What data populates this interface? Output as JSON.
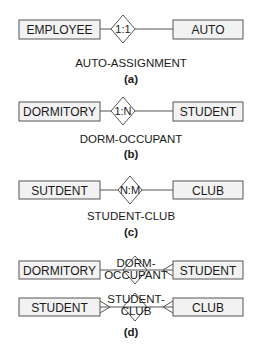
{
  "panels": [
    {
      "id": "a",
      "left_entity": "EMPLOYEE",
      "cardinality": "1:1",
      "right_entity": "AUTO",
      "relationship_name": "AUTO-ASSIGNMENT",
      "caption": "(a)"
    },
    {
      "id": "b",
      "left_entity": "DORMITORY",
      "cardinality": "1:N",
      "right_entity": "STUDENT",
      "relationship_name": "DORM-OCCUPANT",
      "caption": "(b)"
    },
    {
      "id": "c",
      "left_entity": "SUTDENT",
      "cardinality": "N:M",
      "right_entity": "CLUB",
      "relationship_name": "STUDENT-CLUB",
      "caption": "(c)"
    },
    {
      "id": "d",
      "rows": [
        {
          "left_entity": "DORMITORY",
          "relationship_line1": "DORM-",
          "relationship_line2": "OCCUPANT",
          "right_entity": "STUDENT",
          "notation": "crow's foot, many on STUDENT side"
        },
        {
          "left_entity": "STUDENT",
          "relationship_line1": "STUDENT-",
          "relationship_line2": "CLUB",
          "right_entity": "CLUB",
          "notation": "crow's foot, many on both sides"
        }
      ],
      "caption": "(d)"
    }
  ],
  "colors": {
    "entity_fill": "#f2f2f2",
    "stroke": "#555555",
    "text": "#1a1a1a",
    "background": "#ffffff"
  }
}
